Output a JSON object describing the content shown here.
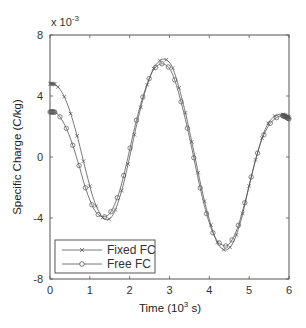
{
  "chart_data": {
    "type": "line",
    "title": "",
    "xlabel": "Time (10^3 s)",
    "xlabel_main": "Time (10",
    "xlabel_sup": "3",
    "xlabel_tail": " s)",
    "ylabel": "Specific Charge (C/kg)",
    "y_multiplier": "x 10",
    "y_multiplier_exp": "-3",
    "xlim": [
      0,
      6
    ],
    "ylim": [
      -8,
      8
    ],
    "xticks": [
      0,
      1,
      2,
      3,
      4,
      5,
      6
    ],
    "yticks": [
      -8,
      -4,
      0,
      4,
      8
    ],
    "grid": false,
    "legend_position": "lower left",
    "series": [
      {
        "name": "Fixed FC",
        "marker": "x",
        "x": [
          0,
          0.1,
          0.2,
          0.35,
          0.5,
          0.7,
          0.9,
          1.1,
          1.3,
          1.45,
          1.6,
          1.8,
          2.0,
          2.2,
          2.4,
          2.6,
          2.75,
          2.9,
          3.05,
          3.2,
          3.4,
          3.6,
          3.8,
          4.0,
          4.2,
          4.4,
          4.6,
          4.8,
          5.0,
          5.2,
          5.4,
          5.6,
          5.8,
          6.0
        ],
        "values": [
          4.8,
          4.78,
          4.6,
          4.0,
          3.0,
          1.2,
          -0.9,
          -2.8,
          -3.9,
          -4.1,
          -3.7,
          -2.2,
          0.0,
          2.4,
          4.4,
          5.8,
          6.3,
          6.4,
          6.0,
          4.9,
          2.9,
          0.5,
          -2.0,
          -4.1,
          -5.6,
          -6.1,
          -5.6,
          -4.1,
          -1.9,
          0.2,
          1.8,
          2.6,
          2.8,
          2.6
        ]
      },
      {
        "name": "Free FC",
        "marker": "o",
        "x": [
          0,
          0.1,
          0.2,
          0.35,
          0.5,
          0.7,
          0.9,
          1.1,
          1.25,
          1.4,
          1.55,
          1.75,
          1.95,
          2.15,
          2.35,
          2.55,
          2.7,
          2.85,
          3.0,
          3.15,
          3.35,
          3.55,
          3.75,
          3.95,
          4.15,
          4.35,
          4.5,
          4.7,
          4.9,
          5.1,
          5.3,
          5.5,
          5.7,
          5.85,
          6.0
        ],
        "values": [
          2.95,
          2.95,
          2.8,
          2.2,
          1.3,
          -0.3,
          -2.1,
          -3.4,
          -3.85,
          -3.9,
          -3.5,
          -2.2,
          -0.1,
          2.2,
          4.1,
          5.5,
          6.0,
          6.1,
          5.8,
          4.9,
          3.0,
          0.7,
          -1.8,
          -3.9,
          -5.3,
          -5.8,
          -5.7,
          -4.7,
          -2.9,
          -0.8,
          1.0,
          2.1,
          2.6,
          2.7,
          2.5
        ]
      }
    ]
  },
  "colors": {
    "line": "#555555",
    "axis": "#555555",
    "marker": "#666666",
    "text": "#333333"
  }
}
